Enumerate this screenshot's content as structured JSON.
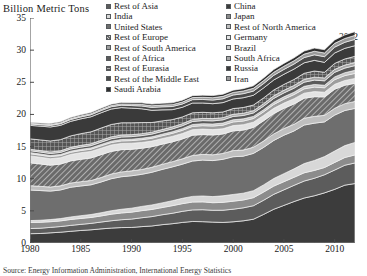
{
  "chart_data": {
    "type": "area",
    "title": "",
    "subtitle": "",
    "ylabel": "Billion Metric Tons",
    "xlabel": "",
    "ylim": [
      0,
      35
    ],
    "xlim": [
      1980,
      2012
    ],
    "yticks": [
      0,
      5,
      10,
      15,
      20,
      25,
      30,
      35
    ],
    "xticks": [
      1980,
      1985,
      1990,
      1995,
      2000,
      2005,
      2010
    ],
    "grid": false,
    "stacked": true,
    "legend_position": "top",
    "annotation": "2012",
    "source": "Source: Energy Information Administration, International Energy Statistics",
    "x": [
      1980,
      1981,
      1982,
      1983,
      1984,
      1985,
      1986,
      1987,
      1988,
      1989,
      1990,
      1991,
      1992,
      1993,
      1994,
      1995,
      1996,
      1997,
      1998,
      1999,
      2000,
      2001,
      2002,
      2003,
      2004,
      2005,
      2006,
      2007,
      2008,
      2009,
      2010,
      2011,
      2012
    ],
    "series": [
      {
        "name": "China",
        "color": "#3c3c3c",
        "pattern": "solid",
        "values": [
          1.45,
          1.48,
          1.58,
          1.68,
          1.82,
          1.95,
          2.05,
          2.2,
          2.32,
          2.4,
          2.42,
          2.55,
          2.65,
          2.85,
          3.0,
          3.2,
          3.35,
          3.32,
          3.25,
          3.2,
          3.3,
          3.45,
          3.7,
          4.45,
          5.25,
          5.85,
          6.45,
          7.0,
          7.35,
          7.8,
          8.35,
          9.0,
          9.25
        ]
      },
      {
        "name": "Rest of Asia",
        "color": "#5c5c5c",
        "pattern": "solid",
        "values": [
          0.8,
          0.82,
          0.85,
          0.88,
          0.92,
          0.95,
          1.0,
          1.06,
          1.14,
          1.22,
          1.3,
          1.38,
          1.46,
          1.54,
          1.62,
          1.72,
          1.8,
          1.86,
          1.84,
          1.9,
          1.96,
          2.02,
          2.1,
          2.2,
          2.32,
          2.42,
          2.52,
          2.64,
          2.72,
          2.82,
          3.0,
          3.1,
          3.2
        ]
      },
      {
        "name": "Japan",
        "color": "#8c8c8c",
        "pattern": "solid",
        "values": [
          0.95,
          0.92,
          0.88,
          0.88,
          0.92,
          0.92,
          0.92,
          0.95,
          1.02,
          1.05,
          1.08,
          1.1,
          1.11,
          1.12,
          1.18,
          1.2,
          1.22,
          1.22,
          1.18,
          1.22,
          1.24,
          1.22,
          1.25,
          1.27,
          1.28,
          1.27,
          1.25,
          1.28,
          1.22,
          1.12,
          1.18,
          1.2,
          1.25
        ]
      },
      {
        "name": "India",
        "color": "#d8d8d8",
        "pattern": "solid",
        "values": [
          0.29,
          0.32,
          0.34,
          0.36,
          0.39,
          0.43,
          0.46,
          0.5,
          0.54,
          0.58,
          0.62,
          0.66,
          0.7,
          0.73,
          0.77,
          0.83,
          0.88,
          0.92,
          0.95,
          1.02,
          1.05,
          1.06,
          1.09,
          1.12,
          1.18,
          1.25,
          1.32,
          1.44,
          1.55,
          1.7,
          1.78,
          1.85,
          1.95
        ]
      },
      {
        "name": "United States",
        "color": "#6e6e6e",
        "pattern": "solid",
        "values": [
          4.75,
          4.62,
          4.42,
          4.45,
          4.62,
          4.62,
          4.62,
          4.78,
          4.98,
          5.06,
          5.04,
          4.99,
          5.08,
          5.2,
          5.26,
          5.31,
          5.5,
          5.58,
          5.6,
          5.68,
          5.87,
          5.76,
          5.8,
          5.83,
          5.92,
          5.98,
          5.89,
          5.99,
          5.8,
          5.4,
          5.59,
          5.46,
          5.29
        ]
      },
      {
        "name": "Rest of North America",
        "color": "#bfbfbf",
        "pattern": "solid",
        "values": [
          0.68,
          0.66,
          0.64,
          0.64,
          0.66,
          0.67,
          0.67,
          0.7,
          0.73,
          0.75,
          0.76,
          0.76,
          0.78,
          0.79,
          0.82,
          0.84,
          0.87,
          0.89,
          0.9,
          0.92,
          0.96,
          0.95,
          0.96,
          0.99,
          1.02,
          1.04,
          1.04,
          1.07,
          1.06,
          1.02,
          1.06,
          1.07,
          1.08
        ]
      },
      {
        "name": "Rest of Europe",
        "color": "#6a6a6a",
        "pattern": "hatch",
        "values": [
          3.55,
          3.48,
          3.4,
          3.38,
          3.44,
          3.48,
          3.5,
          3.55,
          3.52,
          3.46,
          3.35,
          3.3,
          3.2,
          3.14,
          3.08,
          3.08,
          3.14,
          3.08,
          3.08,
          3.02,
          3.06,
          3.1,
          3.08,
          3.14,
          3.16,
          3.14,
          3.16,
          3.1,
          3.06,
          2.86,
          2.96,
          2.86,
          2.82
        ]
      },
      {
        "name": "Germany",
        "color": "#e4e4e4",
        "pattern": "solid",
        "values": [
          1.08,
          1.04,
          1.0,
          1.0,
          1.0,
          1.02,
          1.02,
          1.0,
          0.99,
          0.96,
          0.95,
          0.9,
          0.87,
          0.86,
          0.85,
          0.85,
          0.87,
          0.85,
          0.84,
          0.81,
          0.82,
          0.84,
          0.82,
          0.83,
          0.82,
          0.81,
          0.82,
          0.79,
          0.79,
          0.74,
          0.76,
          0.74,
          0.76
        ]
      },
      {
        "name": "Rest of South America",
        "color": "#9e9e9e",
        "pattern": "solid",
        "values": [
          0.33,
          0.33,
          0.33,
          0.33,
          0.34,
          0.35,
          0.36,
          0.38,
          0.39,
          0.4,
          0.41,
          0.43,
          0.44,
          0.45,
          0.47,
          0.49,
          0.51,
          0.53,
          0.55,
          0.56,
          0.57,
          0.57,
          0.56,
          0.57,
          0.6,
          0.62,
          0.64,
          0.67,
          0.7,
          0.69,
          0.73,
          0.76,
          0.78
        ]
      },
      {
        "name": "Brazil",
        "color": "#c9c9c9",
        "pattern": "solid",
        "values": [
          0.18,
          0.17,
          0.17,
          0.16,
          0.17,
          0.18,
          0.19,
          0.2,
          0.21,
          0.22,
          0.22,
          0.23,
          0.23,
          0.24,
          0.25,
          0.27,
          0.29,
          0.31,
          0.32,
          0.33,
          0.34,
          0.34,
          0.33,
          0.33,
          0.35,
          0.36,
          0.37,
          0.39,
          0.41,
          0.39,
          0.43,
          0.45,
          0.48
        ]
      },
      {
        "name": "Rest of Africa",
        "color": "#5a5a5a",
        "pattern": "solid",
        "values": [
          0.3,
          0.31,
          0.32,
          0.33,
          0.34,
          0.35,
          0.36,
          0.37,
          0.38,
          0.39,
          0.4,
          0.41,
          0.42,
          0.43,
          0.44,
          0.45,
          0.47,
          0.48,
          0.49,
          0.5,
          0.52,
          0.53,
          0.54,
          0.56,
          0.59,
          0.61,
          0.63,
          0.65,
          0.68,
          0.69,
          0.71,
          0.72,
          0.74
        ]
      },
      {
        "name": "South Africa",
        "color": "#a8a8a8",
        "pattern": "solid",
        "values": [
          0.22,
          0.23,
          0.24,
          0.25,
          0.26,
          0.27,
          0.28,
          0.29,
          0.3,
          0.31,
          0.3,
          0.3,
          0.3,
          0.3,
          0.31,
          0.32,
          0.33,
          0.34,
          0.35,
          0.34,
          0.34,
          0.35,
          0.35,
          0.38,
          0.4,
          0.41,
          0.42,
          0.44,
          0.46,
          0.45,
          0.46,
          0.47,
          0.48
        ]
      },
      {
        "name": "Rest of Eurasia",
        "color": "#555555",
        "pattern": "crosshatch",
        "values": [
          1.62,
          1.66,
          1.7,
          1.74,
          1.78,
          1.82,
          1.86,
          1.9,
          1.92,
          1.9,
          1.85,
          1.72,
          1.5,
          1.34,
          1.14,
          1.05,
          1.02,
          0.95,
          0.9,
          0.88,
          0.88,
          0.89,
          0.88,
          0.9,
          0.91,
          0.91,
          0.93,
          0.94,
          0.95,
          0.88,
          0.93,
          0.95,
          0.96
        ]
      },
      {
        "name": "Russia",
        "color": "#3a3a3a",
        "pattern": "solid",
        "values": [
          2.1,
          2.14,
          2.18,
          2.22,
          2.26,
          2.3,
          2.34,
          2.38,
          2.4,
          2.36,
          2.28,
          2.15,
          1.9,
          1.72,
          1.55,
          1.5,
          1.52,
          1.45,
          1.42,
          1.46,
          1.5,
          1.52,
          1.52,
          1.55,
          1.56,
          1.58,
          1.62,
          1.63,
          1.66,
          1.54,
          1.62,
          1.65,
          1.66
        ]
      },
      {
        "name": "Rest of the Middle East",
        "color": "#4a4a4a",
        "pattern": "solid",
        "values": [
          0.21,
          0.22,
          0.24,
          0.26,
          0.28,
          0.3,
          0.32,
          0.34,
          0.36,
          0.38,
          0.4,
          0.43,
          0.45,
          0.47,
          0.49,
          0.51,
          0.53,
          0.55,
          0.57,
          0.59,
          0.61,
          0.63,
          0.65,
          0.68,
          0.72,
          0.75,
          0.78,
          0.82,
          0.86,
          0.88,
          0.91,
          0.94,
          0.98
        ]
      },
      {
        "name": "Iran",
        "color": "#9a9a9a",
        "pattern": "solid",
        "values": [
          0.11,
          0.12,
          0.13,
          0.14,
          0.15,
          0.16,
          0.17,
          0.18,
          0.19,
          0.2,
          0.22,
          0.24,
          0.26,
          0.28,
          0.29,
          0.31,
          0.32,
          0.34,
          0.36,
          0.38,
          0.4,
          0.42,
          0.44,
          0.46,
          0.48,
          0.5,
          0.52,
          0.54,
          0.56,
          0.58,
          0.59,
          0.6,
          0.62
        ]
      },
      {
        "name": "Saudi Arabia",
        "color": "#2e2e2e",
        "pattern": "solid",
        "values": [
          0.13,
          0.14,
          0.15,
          0.16,
          0.17,
          0.18,
          0.19,
          0.2,
          0.21,
          0.22,
          0.23,
          0.25,
          0.26,
          0.27,
          0.28,
          0.29,
          0.3,
          0.32,
          0.33,
          0.34,
          0.35,
          0.36,
          0.38,
          0.4,
          0.42,
          0.44,
          0.45,
          0.47,
          0.49,
          0.51,
          0.53,
          0.55,
          0.58
        ]
      }
    ]
  },
  "axis": {
    "ylabel": "Billion Metric Tons",
    "yticks": [
      "0",
      "5",
      "10",
      "15",
      "20",
      "25",
      "30",
      "35"
    ],
    "xticks": [
      "1980",
      "1985",
      "1990",
      "1995",
      "2000",
      "2005",
      "2010"
    ]
  },
  "legend": {
    "column_left": [
      {
        "label": "Rest of Asia",
        "color": "#5c5c5c",
        "pattern": "solid"
      },
      {
        "label": "India",
        "color": "#d8d8d8",
        "pattern": "solid"
      },
      {
        "label": "United States",
        "color": "#6e6e6e",
        "pattern": "solid"
      },
      {
        "label": "Rest of Europe",
        "color": "#6a6a6a",
        "pattern": "hatch"
      },
      {
        "label": "Rest of South America",
        "color": "#9e9e9e",
        "pattern": "solid"
      },
      {
        "label": "Rest of Africa",
        "color": "#5a5a5a",
        "pattern": "solid"
      },
      {
        "label": "Rest of Eurasia",
        "color": "#555555",
        "pattern": "crosshatch"
      },
      {
        "label": "Rest of the Middle East",
        "color": "#4a4a4a",
        "pattern": "solid"
      },
      {
        "label": "Saudi Arabia",
        "color": "#2e2e2e",
        "pattern": "solid"
      }
    ],
    "column_right": [
      {
        "label": "China",
        "color": "#3c3c3c",
        "pattern": "solid"
      },
      {
        "label": "Japan",
        "color": "#8c8c8c",
        "pattern": "solid"
      },
      {
        "label": "Rest of North America",
        "color": "#bfbfbf",
        "pattern": "solid"
      },
      {
        "label": "Germany",
        "color": "#e4e4e4",
        "pattern": "solid"
      },
      {
        "label": "Brazil",
        "color": "#c9c9c9",
        "pattern": "solid"
      },
      {
        "label": "South Africa",
        "color": "#a8a8a8",
        "pattern": "solid"
      },
      {
        "label": "Russia",
        "color": "#3a3a3a",
        "pattern": "solid"
      },
      {
        "label": "Iran",
        "color": "#9a9a9a",
        "pattern": "solid"
      }
    ]
  },
  "annotation": {
    "year": "2012"
  },
  "source": {
    "text": "Source: Energy Information Administration, International Energy Statistics"
  }
}
